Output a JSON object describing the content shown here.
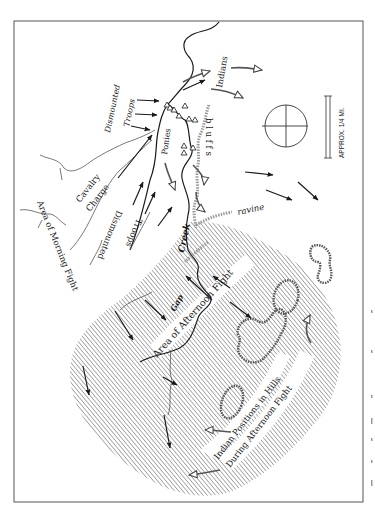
{
  "map": {
    "title": "Battle map: Morning and Afternoon Fight",
    "orientation": "rotated 90° (north arrow / compass at right)",
    "colors": {
      "ink": "#1a1a1a",
      "hatch": "#7a7a7a",
      "bluff": "#9a9a9a",
      "background": "#ffffff",
      "border": "#555555"
    },
    "labels": {
      "dismounted_troops_top": [
        "Dismounted",
        "Troops"
      ],
      "ponies": "Ponies",
      "indians": "Indians",
      "bluffs": "b l u f f s",
      "ravine": "ravine",
      "cavalry_charge": [
        "Cavalry",
        "Charge"
      ],
      "dismounted_troops_mid": [
        "Dismounted",
        "Troops"
      ],
      "creek": "Creek",
      "gap": "Gap",
      "area_morning_fight": "Area of Morning Fight",
      "area_afternoon_fight": "Area of Afternoon Fight",
      "indian_positions": [
        "Indian Positions in Hills",
        "During Afternoon Fight"
      ]
    },
    "scale_bar": {
      "label": "APPROX. 1/4 MI."
    },
    "compass": {
      "icon": "compass-crosshair-icon"
    },
    "legend_symbols": {
      "troop_arrow": "solid-black-arrow-icon",
      "indian_arrow": "open-head-gray-arrow-icon",
      "tipi": "tipi-triangle-icon",
      "hill": "hill-outline-icon"
    }
  }
}
